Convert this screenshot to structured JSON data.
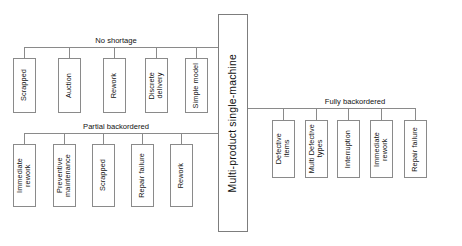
{
  "diagram": {
    "type": "tree-hierarchy",
    "orientation": "horizontal-root-center",
    "line_color": "#8a8a8a",
    "box_border_color": "#8a8a8a",
    "background_color": "#ffffff",
    "text_color": "#111111"
  },
  "root": {
    "label": "Multi-product single-machine",
    "x": 218,
    "y": 14,
    "width": 30,
    "height": 218
  },
  "branches": [
    {
      "id": "no-shortage",
      "label": "No shortage",
      "side": "left",
      "connector_y": 47,
      "label_x": 116,
      "label_y": 36,
      "nodes": [
        {
          "label": "Scrapped",
          "x": 13,
          "y": 58,
          "width": 23,
          "height": 55
        },
        {
          "label": "Auction",
          "x": 58,
          "y": 58,
          "width": 23,
          "height": 55
        },
        {
          "label": "Rework",
          "x": 103,
          "y": 58,
          "width": 23,
          "height": 55
        },
        {
          "label": "Discrete\ndelivery",
          "x": 145,
          "y": 58,
          "width": 23,
          "height": 55
        },
        {
          "label": "Simple model",
          "x": 185,
          "y": 58,
          "width": 23,
          "height": 55
        }
      ]
    },
    {
      "id": "partial-backordered",
      "label": "Partial backordered",
      "side": "left",
      "connector_y": 133,
      "label_x": 116,
      "label_y": 122,
      "nodes": [
        {
          "label": "Immediate\nrework",
          "x": 13,
          "y": 144,
          "width": 23,
          "height": 63
        },
        {
          "label": "Preventive\nmaintenance",
          "x": 53,
          "y": 144,
          "width": 23,
          "height": 63
        },
        {
          "label": "Scrapped",
          "x": 92,
          "y": 144,
          "width": 23,
          "height": 63
        },
        {
          "label": "Repair failure",
          "x": 131,
          "y": 144,
          "width": 23,
          "height": 63
        },
        {
          "label": "Rework",
          "x": 170,
          "y": 144,
          "width": 23,
          "height": 63
        }
      ]
    },
    {
      "id": "fully-backordered",
      "label": "Fully backordered",
      "side": "right",
      "connector_y": 108,
      "label_x": 355,
      "label_y": 97,
      "nodes": [
        {
          "label": "Defective\nitems",
          "x": 272,
          "y": 120,
          "width": 23,
          "height": 58
        },
        {
          "label": "Multi Defective\ntypes",
          "x": 305,
          "y": 120,
          "width": 23,
          "height": 58
        },
        {
          "label": "Interruption",
          "x": 337,
          "y": 120,
          "width": 23,
          "height": 58
        },
        {
          "label": "Immediate\nrework",
          "x": 370,
          "y": 120,
          "width": 23,
          "height": 58
        },
        {
          "label": "Repair failure",
          "x": 404,
          "y": 120,
          "width": 23,
          "height": 58
        }
      ]
    }
  ]
}
